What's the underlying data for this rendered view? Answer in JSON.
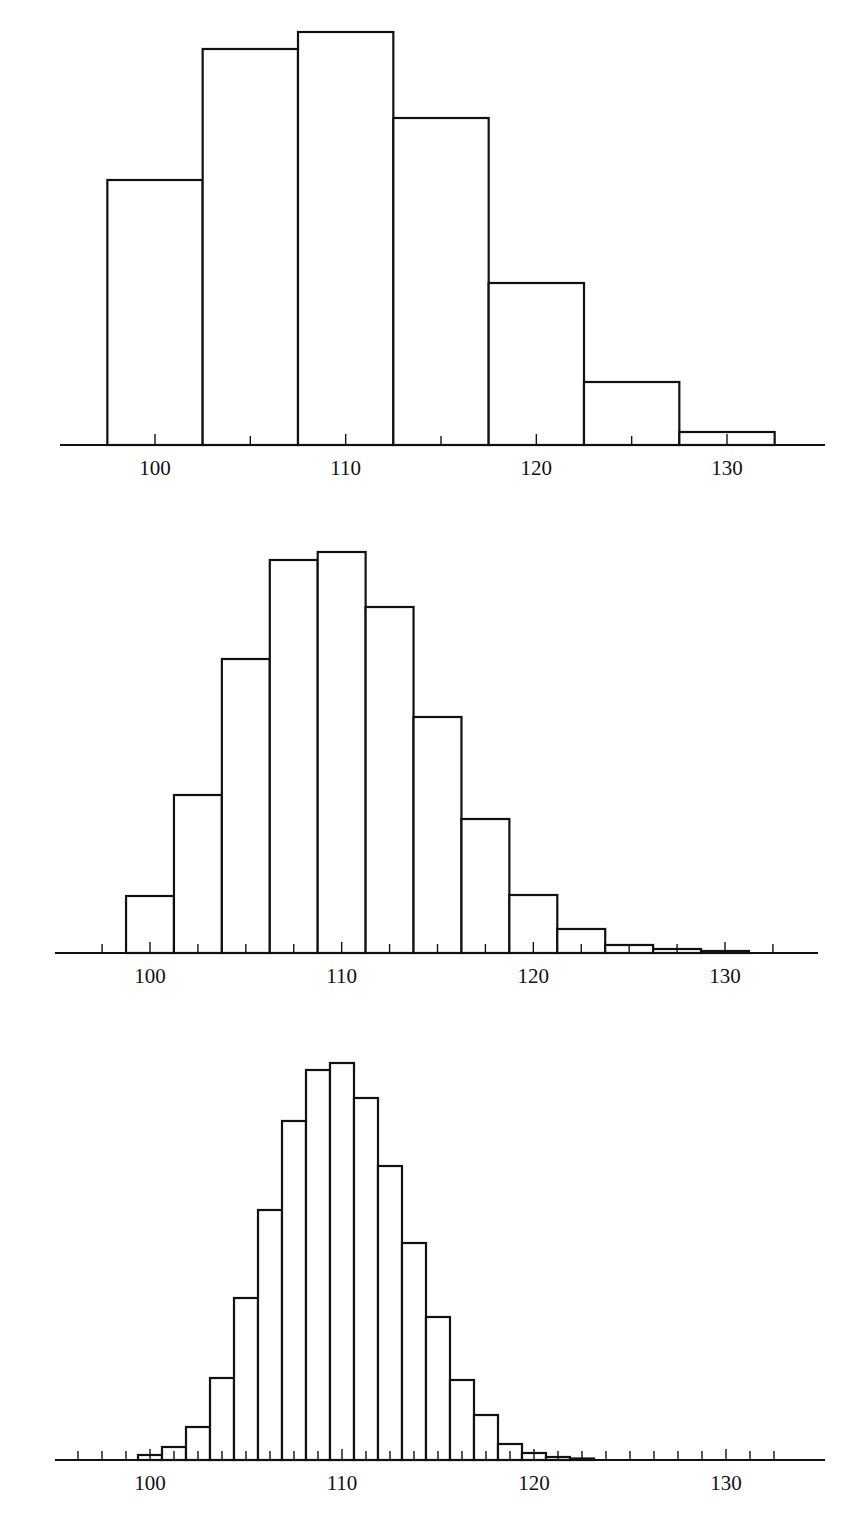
{
  "chart_data": [
    {
      "type": "bar",
      "subtype": "histogram",
      "title": "",
      "xlabel": "",
      "ylabel": "",
      "bin_width": 5,
      "bin_centers": [
        100,
        105,
        110,
        115,
        120,
        125,
        130
      ],
      "values": [
        265,
        396,
        413,
        327,
        162,
        63,
        13
      ],
      "values_unit": "relative height (px, no y-axis shown)",
      "xlim": [
        93,
        135
      ],
      "x_tick_labels": [
        "100",
        "110",
        "120",
        "130"
      ],
      "x_tick_label_values": [
        100,
        110,
        120,
        130
      ],
      "minor_tick_step": 5,
      "grid": false,
      "legend": null,
      "layout": {
        "axis_y": 445,
        "x100_px": 155,
        "x130_px": 727,
        "axis_x0_px": 60,
        "axis_x1_px": 825
      }
    },
    {
      "type": "bar",
      "subtype": "histogram",
      "title": "",
      "xlabel": "",
      "ylabel": "",
      "bin_width": 2.5,
      "bin_centers": [
        100,
        102.5,
        105,
        107.5,
        110,
        112.5,
        115,
        117.5,
        120,
        122.5,
        125,
        127.5,
        130
      ],
      "values": [
        57,
        158,
        294,
        393,
        401,
        346,
        236,
        134,
        58,
        24,
        8,
        4,
        2
      ],
      "values_unit": "relative height (px, no y-axis shown)",
      "xlim": [
        95,
        135
      ],
      "x_tick_labels": [
        "100",
        "110",
        "120",
        "130"
      ],
      "x_tick_label_values": [
        100,
        110,
        120,
        130
      ],
      "minor_tick_step": 2.5,
      "grid": false,
      "legend": null,
      "layout": {
        "axis_y": 453,
        "x100_px": 150,
        "x130_px": 725,
        "axis_x0_px": 55,
        "axis_x1_px": 818
      }
    },
    {
      "type": "bar",
      "subtype": "histogram",
      "title": "",
      "xlabel": "",
      "ylabel": "",
      "bin_width": 1.25,
      "bin_centers": [
        100,
        101.25,
        102.5,
        103.75,
        105,
        106.25,
        107.5,
        108.75,
        110,
        111.25,
        112.5,
        113.75,
        115,
        116.25,
        117.5,
        118.75,
        120,
        121.25,
        122.5
      ],
      "values": [
        5,
        13,
        33,
        82,
        162,
        250,
        339,
        390,
        397,
        362,
        294,
        217,
        143,
        80,
        45,
        16,
        7,
        3,
        1.5
      ],
      "values_unit": "relative height (px, no y-axis shown)",
      "xlim": [
        95,
        135
      ],
      "x_tick_labels": [
        "100",
        "110",
        "120",
        "130"
      ],
      "x_tick_label_values": [
        100,
        110,
        120,
        130
      ],
      "minor_tick_step": 1.25,
      "grid": false,
      "legend": null,
      "layout": {
        "axis_y": 455,
        "x100_px": 150,
        "x130_px": 726,
        "axis_x0_px": 55,
        "axis_x1_px": 825
      }
    }
  ]
}
